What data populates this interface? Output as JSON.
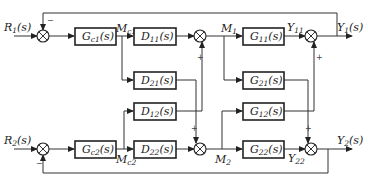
{
  "diagram": {
    "type": "block-diagram",
    "inputs": [
      {
        "id": "R1",
        "label": "R",
        "sub": "1",
        "suffix": "(s)"
      },
      {
        "id": "R2",
        "label": "R",
        "sub": "2",
        "suffix": "(s)"
      }
    ],
    "outputs": [
      {
        "id": "Y1",
        "label": "Y",
        "sub": "1",
        "suffix": "(s)"
      },
      {
        "id": "Y2",
        "label": "Y",
        "sub": "2",
        "suffix": "(s)"
      }
    ],
    "blocks": [
      {
        "id": "Gc1",
        "label": "G",
        "sub": "c1",
        "suffix": "(s)"
      },
      {
        "id": "Gc2",
        "label": "G",
        "sub": "c2",
        "suffix": "(s)"
      },
      {
        "id": "D11",
        "label": "D",
        "sub": "11",
        "suffix": "(s)"
      },
      {
        "id": "D21",
        "label": "D",
        "sub": "21",
        "suffix": "(s)"
      },
      {
        "id": "D12",
        "label": "D",
        "sub": "12",
        "suffix": "(s)"
      },
      {
        "id": "D22",
        "label": "D",
        "sub": "22",
        "suffix": "(s)"
      },
      {
        "id": "G11",
        "label": "G",
        "sub": "11",
        "suffix": "(s)"
      },
      {
        "id": "G21",
        "label": "G",
        "sub": "21",
        "suffix": "(s)"
      },
      {
        "id": "G12",
        "label": "G",
        "sub": "12",
        "suffix": "(s)"
      },
      {
        "id": "G22",
        "label": "G",
        "sub": "22",
        "suffix": "(s)"
      }
    ],
    "signals": [
      {
        "id": "Mc1",
        "label": "M",
        "sub": "c1"
      },
      {
        "id": "Mc2",
        "label": "M",
        "sub": "c2"
      },
      {
        "id": "M1",
        "label": "M",
        "sub": "1"
      },
      {
        "id": "M2",
        "label": "M",
        "sub": "2"
      },
      {
        "id": "Y11",
        "label": "Y",
        "sub": "11"
      },
      {
        "id": "Y22",
        "label": "Y",
        "sub": "22"
      }
    ],
    "signs": {
      "minus": "−",
      "plus": "+"
    }
  }
}
